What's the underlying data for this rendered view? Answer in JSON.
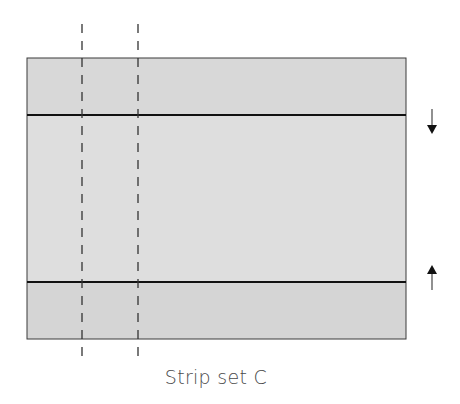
{
  "diagram": {
    "caption": "Strip set C",
    "colors": {
      "outer_strip_fill": "#d9d9d9",
      "center_strip_fill": "#dedede",
      "outline": "#3a3a3a",
      "seam": "#1a1a1a",
      "cut_line": "#333333",
      "arrow": "#222222"
    },
    "strips": [
      {
        "name": "top-strip",
        "y": 58,
        "height": 57
      },
      {
        "name": "center-strip",
        "y": 115,
        "height": 167
      },
      {
        "name": "bottom-strip",
        "y": 282,
        "height": 57
      }
    ],
    "cut_lines": [
      82,
      138
    ],
    "press_arrows": [
      {
        "name": "press-arrow-down",
        "direction": "down",
        "glyph": "↓"
      },
      {
        "name": "press-arrow-up",
        "direction": "up",
        "glyph": "↑"
      }
    ]
  }
}
